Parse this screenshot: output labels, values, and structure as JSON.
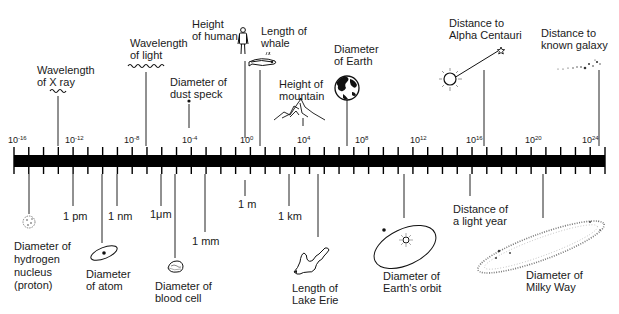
{
  "chart_data": {
    "type": "scale-diagram",
    "title": "",
    "axis": {
      "scale": "log10",
      "unit": "m",
      "range_exponent": [
        -16,
        24
      ],
      "tick_every_exponent": 1,
      "labeled_exponents": [
        -16,
        -12,
        -8,
        -4,
        0,
        4,
        8,
        12,
        16,
        20,
        24
      ],
      "tick_labels": [
        "10-16",
        "10-12",
        "10-8",
        "10-4",
        "100",
        "104",
        "108",
        "1012",
        "1016",
        "1020",
        "1024"
      ]
    },
    "above": [
      {
        "label": "Wavelength of X ray",
        "exponent": -13,
        "icon": "wave-icon"
      },
      {
        "label": "Wavelength of light",
        "exponent": -7,
        "icon": "wave-icon"
      },
      {
        "label": "Diameter of dust speck",
        "exponent": -4,
        "icon": "dot-icon"
      },
      {
        "label": "Height of human",
        "exponent": 0.2,
        "icon": "human-icon"
      },
      {
        "label": "Length of whale",
        "exponent": 1.3,
        "icon": "whale-icon"
      },
      {
        "label": "Height of mountain",
        "exponent": 4,
        "icon": "mountain-icon"
      },
      {
        "label": "Diameter of Earth",
        "exponent": 7,
        "icon": "earth-icon"
      },
      {
        "label": "Distance to Alpha Centauri",
        "exponent": 16.6,
        "icon": "sun-star-icon"
      },
      {
        "label": "Distance to known galaxy",
        "exponent": 23.6,
        "icon": "galaxy-icon"
      }
    ],
    "below": [
      {
        "label": "Diameter of hydrogen nucleus (proton)",
        "exponent": -15,
        "icon": "proton-icon"
      },
      {
        "label": "1 pm",
        "exponent": -12
      },
      {
        "label": "Diameter of atom",
        "exponent": -10,
        "icon": "atom-icon"
      },
      {
        "label": "1 nm",
        "exponent": -9
      },
      {
        "label": "1μm",
        "exponent": -6
      },
      {
        "label": "Diameter of blood cell",
        "exponent": -5,
        "icon": "blood-cell-icon"
      },
      {
        "label": "1 mm",
        "exponent": -3
      },
      {
        "label": "1 m",
        "exponent": 0
      },
      {
        "label": "1 km",
        "exponent": 3
      },
      {
        "label": "Length of Lake Erie",
        "exponent": 5,
        "icon": "lake-icon"
      },
      {
        "label": "Diameter of Earth's orbit",
        "exponent": 11,
        "icon": "orbit-icon"
      },
      {
        "label": "Distance of a light year",
        "exponent": 16,
        "icon": null
      },
      {
        "label": "Diameter of Milky Way",
        "exponent": 21,
        "icon": "milky-way-icon"
      }
    ]
  },
  "ticks": {
    "t0": "10",
    "t0e": "-16",
    "t1": "10",
    "t1e": "-12",
    "t2": "10",
    "t2e": "-8",
    "t3": "10",
    "t3e": "-4",
    "t4": "10",
    "t4e": "0",
    "t5": "10",
    "t5e": "4",
    "t6": "10",
    "t6e": "8",
    "t7": "10",
    "t7e": "12",
    "t8": "10",
    "t8e": "16",
    "t9": "10",
    "t9e": "20",
    "t10": "10",
    "t10e": "24"
  },
  "labels": {
    "xray": "Wavelength\nof X ray",
    "light": "Wavelength\nof light",
    "dust": "Diameter of\ndust speck",
    "human": "Height\nof human",
    "whale": "Length of\nwhale",
    "mountain": "Height of\nmountain",
    "earth": "Diameter\nof Earth",
    "alpha": "Distance to\nAlpha Centauri",
    "galaxy": "Distance to\nknown galaxy",
    "proton": "Diameter of\nhydrogen\nnucleus\n(proton)",
    "pm": "1 pm",
    "atom": "Diameter\nof atom",
    "nm": "1 nm",
    "um": "1μm",
    "blood": "Diameter of\nblood cell",
    "mm": "1 mm",
    "m": "1 m",
    "km": "1 km",
    "erie": "Length of\nLake Erie",
    "orbit": "Diameter of\nEarth's orbit",
    "lightyear": "Distance of\na light year",
    "milkyway": "Diameter of\nMilky Way"
  }
}
